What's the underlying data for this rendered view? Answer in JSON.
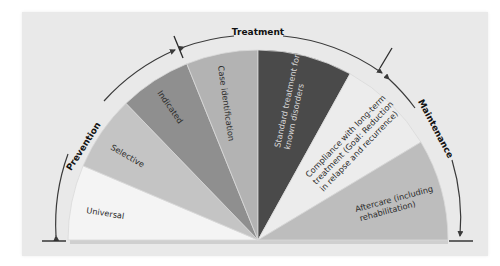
{
  "diagram": {
    "type": "semicircular-spectrum",
    "phases": [
      {
        "id": "prevention",
        "label": "Prevention"
      },
      {
        "id": "treatment",
        "label": "Treatment"
      },
      {
        "id": "maintenance",
        "label": "Maintenance"
      }
    ],
    "segments": [
      {
        "id": "universal",
        "label": "Universal",
        "phase": "prevention",
        "color": "#f4f4f4"
      },
      {
        "id": "selective",
        "label": "Selective",
        "phase": "prevention",
        "color": "#c4c4c4"
      },
      {
        "id": "indicated",
        "label": "Indicated",
        "phase": "prevention",
        "color": "#8f8f8f"
      },
      {
        "id": "case-identification",
        "label": "Case identification",
        "phase": "treatment",
        "color": "#b3b3b3"
      },
      {
        "id": "standard-treatment",
        "label_lines": [
          "Standard treatment for",
          "known disorders"
        ],
        "phase": "treatment",
        "color": "#4a4a4a"
      },
      {
        "id": "compliance",
        "label_lines": [
          "Compliance with long-term",
          "treatment (Goal: Reduction",
          "in relapse and recurrence)"
        ],
        "phase": "maintenance",
        "color": "#ececec"
      },
      {
        "id": "aftercare",
        "label_lines": [
          "Aftercare (including",
          "rehabilitation)"
        ],
        "phase": "maintenance",
        "color": "#bdbdbd"
      }
    ],
    "colors": {
      "panel_background": "#e9e9e9",
      "arc_line": "#3a3a3a",
      "segment_edge": "#d8d8d8"
    }
  }
}
